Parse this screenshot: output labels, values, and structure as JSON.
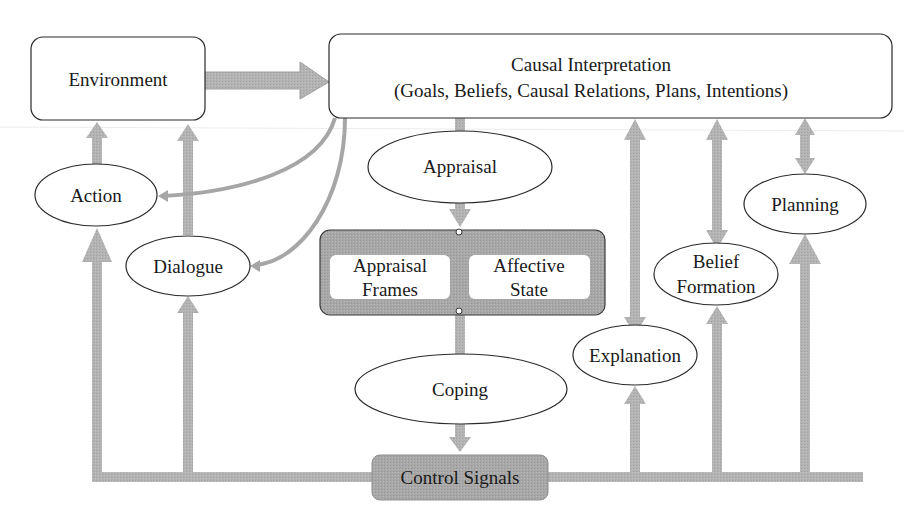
{
  "diagram": {
    "type": "flow-diagram",
    "nodes": {
      "environment": {
        "label": "Environment",
        "shape": "rounded-rect"
      },
      "causal_interpretation": {
        "line1": "Causal Interpretation",
        "line2": "(Goals, Beliefs, Causal Relations, Plans, Intentions)",
        "shape": "rounded-rect"
      },
      "appraisal": {
        "label": "Appraisal",
        "shape": "ellipse"
      },
      "appraisal_frames": {
        "line1": "Appraisal",
        "line2": "Frames",
        "shape": "rounded-rect"
      },
      "affective_state": {
        "line1": "Affective",
        "line2": "State",
        "shape": "rounded-rect"
      },
      "coping": {
        "label": "Coping",
        "shape": "ellipse"
      },
      "control_signals": {
        "label": "Control Signals",
        "shape": "rounded-rect-gray"
      },
      "action": {
        "label": "Action",
        "shape": "ellipse"
      },
      "dialogue": {
        "label": "Dialogue",
        "shape": "ellipse"
      },
      "explanation": {
        "label": "Explanation",
        "shape": "ellipse"
      },
      "belief_formation": {
        "line1": "Belief",
        "line2": "Formation",
        "shape": "ellipse"
      },
      "planning": {
        "label": "Planning",
        "shape": "ellipse"
      }
    },
    "edges": [
      {
        "from": "Environment",
        "to": "Causal Interpretation"
      },
      {
        "from": "Causal Interpretation",
        "to": "Appraisal"
      },
      {
        "from": "Appraisal",
        "to": "Appraisal Frames / Affective State"
      },
      {
        "from": "Appraisal Frames / Affective State",
        "to": "Coping"
      },
      {
        "from": "Coping",
        "to": "Control Signals"
      },
      {
        "from": "Control Signals",
        "to": "Action"
      },
      {
        "from": "Control Signals",
        "to": "Dialogue"
      },
      {
        "from": "Control Signals",
        "to": "Explanation"
      },
      {
        "from": "Control Signals",
        "to": "Belief Formation"
      },
      {
        "from": "Control Signals",
        "to": "Planning"
      },
      {
        "from": "Action",
        "to": "Environment"
      },
      {
        "from": "Dialogue",
        "to": "Environment"
      },
      {
        "from": "Causal Interpretation",
        "to": "Action"
      },
      {
        "from": "Causal Interpretation",
        "to": "Dialogue"
      },
      {
        "from": "Causal Interpretation",
        "to": "Explanation",
        "bidirectional": true
      },
      {
        "from": "Causal Interpretation",
        "to": "Belief Formation",
        "bidirectional": true
      },
      {
        "from": "Causal Interpretation",
        "to": "Planning",
        "bidirectional": true
      }
    ],
    "colors": {
      "arrow": "#b4b4b4",
      "arrow_edge": "#9a9a9a",
      "node_fill": "#ffffff",
      "node_stroke": "#2a2a2a",
      "panel_fill": "#a9a9a9",
      "text": "#1a1a1a"
    }
  }
}
